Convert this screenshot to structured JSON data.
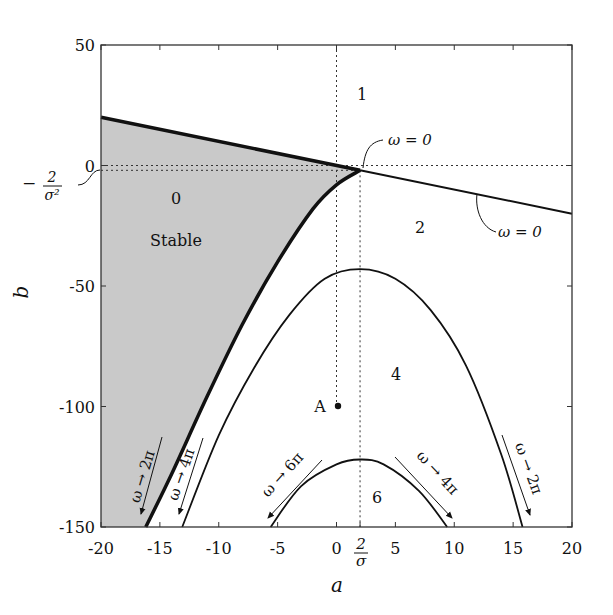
{
  "chart_data": {
    "type": "line",
    "title": "",
    "xlabel": "a",
    "ylabel": "b",
    "xlim": [
      -20,
      20
    ],
    "ylim": [
      -150,
      50
    ],
    "grid": false,
    "x_ticks": [
      -20,
      -15,
      -10,
      -5,
      0,
      5,
      10,
      15,
      20
    ],
    "x_tick_labels": [
      "-20",
      "-15",
      "-10",
      "-5",
      "0",
      "5",
      "10",
      "15",
      "20"
    ],
    "extra_x_tick": {
      "value": 2,
      "label": "2/σ"
    },
    "y_ticks": [
      50,
      0,
      -50,
      -100,
      -150
    ],
    "y_tick_labels": [
      "50",
      "0",
      "-50",
      "-100",
      "-150"
    ],
    "extra_y_tick": {
      "value": -2,
      "label": "-2/σ²"
    },
    "reference_lines": [
      {
        "orientation": "vertical",
        "value": 0,
        "style": "dotted"
      },
      {
        "orientation": "vertical",
        "value": 2,
        "style": "dotted"
      },
      {
        "orientation": "horizontal",
        "value": 0,
        "style": "dotted"
      },
      {
        "orientation": "horizontal",
        "value": -2,
        "style": "dotted"
      }
    ],
    "series": [
      {
        "name": "omega=0 line",
        "style": "solid",
        "points": [
          [
            -20,
            20
          ],
          [
            2,
            -2
          ],
          [
            20,
            -20
          ]
        ]
      },
      {
        "name": "stability boundary (omega→2π)",
        "style": "thick",
        "points": [
          [
            2,
            -2
          ],
          [
            0,
            -8
          ],
          [
            -2,
            -18
          ],
          [
            -5,
            -40
          ],
          [
            -8,
            -66
          ],
          [
            -11,
            -96
          ],
          [
            -14,
            -128
          ],
          [
            -16.2,
            -150
          ]
        ]
      },
      {
        "name": "curve 4π/2π",
        "style": "solid",
        "points": [
          [
            -13.1,
            -150
          ],
          [
            -10,
            -112
          ],
          [
            -7,
            -84
          ],
          [
            -4,
            -62
          ],
          [
            -1,
            -47
          ],
          [
            2,
            -43
          ],
          [
            5,
            -47
          ],
          [
            8,
            -60
          ],
          [
            11,
            -83
          ],
          [
            14,
            -120
          ],
          [
            15.8,
            -150
          ]
        ]
      },
      {
        "name": "curve 6π/4π",
        "style": "solid",
        "points": [
          [
            -5.6,
            -150
          ],
          [
            -3,
            -133
          ],
          [
            0,
            -124
          ],
          [
            2,
            -122
          ],
          [
            4,
            -124
          ],
          [
            7,
            -135
          ],
          [
            9.4,
            -150
          ]
        ]
      }
    ],
    "shaded_region": {
      "label": "Stable",
      "color": "#c8c8c8"
    },
    "point": {
      "label": "A",
      "a": 0,
      "b": -100
    },
    "region_labels": [
      {
        "text": "1",
        "a": 2,
        "b": 30
      },
      {
        "text": "0",
        "a": -14,
        "b": -13
      },
      {
        "text": "Stable",
        "a": -13.5,
        "b": -30
      },
      {
        "text": "2",
        "a": 9,
        "b": -25
      },
      {
        "text": "4",
        "a": 7,
        "b": -87
      },
      {
        "text": "6",
        "a": 3.5,
        "b": -138
      }
    ],
    "annotations": [
      {
        "text": "ω = 0",
        "near": "top-right of intersection"
      },
      {
        "text": "ω = 0",
        "near": "right line"
      },
      {
        "text": "ω → 2π",
        "near": "left thick boundary"
      },
      {
        "text": "ω → 4π",
        "near": "left branch of large arch"
      },
      {
        "text": "ω → 6π",
        "near": "left branch of small arch"
      },
      {
        "text": "ω → 4π",
        "near": "right branch of small arch"
      },
      {
        "text": "ω → 2π",
        "near": "right branch of large arch"
      }
    ]
  },
  "labels": {
    "xlabel": "a",
    "ylabel": "b",
    "two_over_sigma_num": "2",
    "two_over_sigma_den": "σ",
    "neg_two_over_sigma2_sign": "−",
    "neg_two_over_sigma2_num": "2",
    "neg_two_over_sigma2_den": "σ²",
    "omega_zero_top": "ω = 0",
    "omega_zero_right": "ω = 0",
    "region1": "1",
    "region0": "0",
    "stable": "Stable",
    "region2": "2",
    "region4": "4",
    "region6": "6",
    "pointA": "A",
    "ann_left_2pi": "ω → 2π",
    "ann_left_4pi": "ω → 4π",
    "ann_left_6pi": "ω → 6π",
    "ann_right_4pi": "ω → 4π",
    "ann_right_2pi": "ω → 2π"
  },
  "colors": {
    "shade": "#c9c9c9",
    "ink": "#111111"
  }
}
